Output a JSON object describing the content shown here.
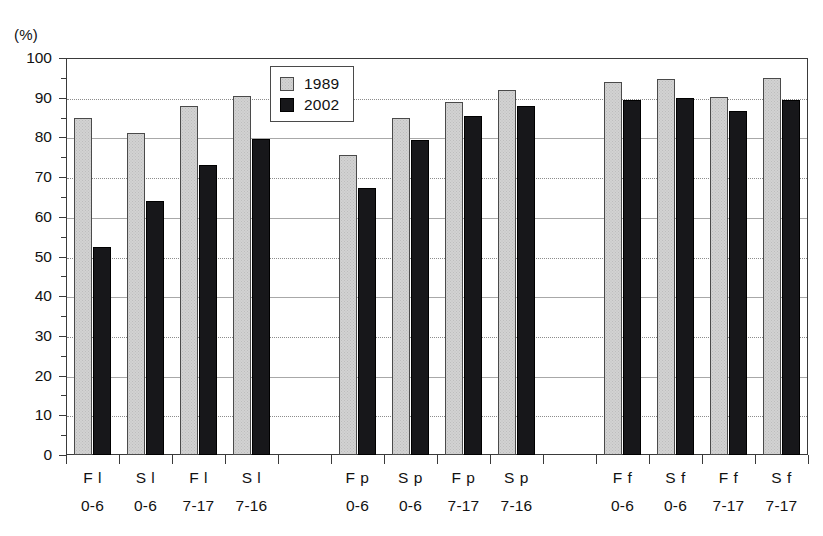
{
  "chart_data": {
    "type": "bar",
    "title": "",
    "xlabel": "",
    "ylabel": "(%)",
    "ylim": [
      0,
      100
    ],
    "ytick_step": 10,
    "grid": true,
    "legend_position": "top-center",
    "ytick_labels": [
      "100",
      "90",
      "80",
      "70",
      "60",
      "50",
      "40",
      "30",
      "20",
      "10",
      "0"
    ],
    "categories": [
      "F l 0-6",
      "S l 0-6",
      "F l 7-17",
      "S l 7-16",
      "F p 0-6",
      "S p 0-6",
      "F p 7-17",
      "S p 7-16",
      "F f 0-6",
      "S f 0-6",
      "F f 7-17",
      "S f 7-17"
    ],
    "category_parts": [
      {
        "cat": "F l",
        "age": "0-6"
      },
      {
        "cat": "S l",
        "age": "0-6"
      },
      {
        "cat": "F l",
        "age": "7-17"
      },
      {
        "cat": "S l",
        "age": "7-16"
      },
      {
        "cat": "F p",
        "age": "0-6"
      },
      {
        "cat": "S p",
        "age": "0-6"
      },
      {
        "cat": "F p",
        "age": "7-17"
      },
      {
        "cat": "S p",
        "age": "7-16"
      },
      {
        "cat": "F f",
        "age": "0-6"
      },
      {
        "cat": "S f",
        "age": "0-6"
      },
      {
        "cat": "F f",
        "age": "7-17"
      },
      {
        "cat": "S f",
        "age": "7-17"
      }
    ],
    "series": [
      {
        "name": "1989",
        "color": "#d2d2d2",
        "values": [
          85,
          81,
          88,
          90.5,
          75.5,
          85,
          89,
          92,
          94,
          94.8,
          90.3,
          95
        ]
      },
      {
        "name": "2002",
        "color": "#17171a",
        "values": [
          52.5,
          64,
          73,
          79.5,
          67.3,
          79.3,
          85.3,
          88,
          89.5,
          90,
          86.7,
          89.3
        ]
      }
    ],
    "slot_layout": [
      "bar",
      "bar",
      "bar",
      "bar",
      "gap",
      "bar",
      "bar",
      "bar",
      "bar",
      "gap",
      "bar",
      "bar",
      "bar",
      "bar"
    ]
  },
  "legend": {
    "items": [
      {
        "label": "1989"
      },
      {
        "label": "2002"
      }
    ]
  }
}
